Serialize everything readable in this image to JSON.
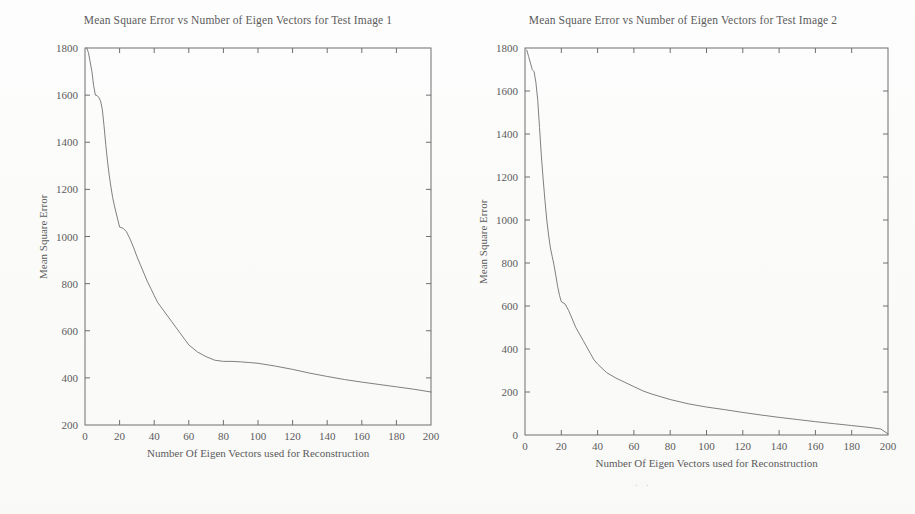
{
  "page": {
    "background": "#ffffff",
    "ink_color": "#5b5b5b",
    "axis_color": "#6e6e6e"
  },
  "figures": [
    {
      "id": "figure-1",
      "title": "Mean Square Error vs Number of Eigen Vectors for Test Image 1",
      "xlabel": "Number Of Eigen Vectors used for Reconstruction",
      "ylabel": "Mean Square Error"
    },
    {
      "id": "figure-2",
      "title": "Mean Square Error vs Number of Eigen Vectors for Test Image 2",
      "xlabel": "Number Of Eigen Vectors used for Reconstruction",
      "ylabel": "Mean Square Error"
    }
  ],
  "artifacts": {
    "scan_smudge_below_fig2": ". ."
  },
  "chart_data": [
    {
      "type": "line",
      "title": "Mean Square Error vs Number of Eigen Vectors for Test Image 1",
      "xlabel": "Number Of Eigen Vectors used for Reconstruction",
      "ylabel": "Mean Square Error",
      "xlim": [
        0,
        200
      ],
      "ylim": [
        200,
        1800
      ],
      "xticks": [
        0,
        20,
        40,
        60,
        80,
        100,
        120,
        140,
        160,
        180,
        200
      ],
      "yticks": [
        200,
        400,
        600,
        800,
        1000,
        1200,
        1400,
        1600,
        1800
      ],
      "grid": false,
      "legend": null,
      "line_color": "#6a6a6a",
      "series": [
        {
          "name": "Test Image 1 MSE",
          "x": [
            1,
            2,
            3,
            4,
            5,
            6,
            7,
            8,
            9,
            10,
            11,
            12,
            13,
            14,
            15,
            16,
            17,
            18,
            19,
            20,
            22,
            24,
            26,
            28,
            30,
            32,
            34,
            36,
            38,
            40,
            42,
            44,
            46,
            48,
            50,
            52,
            55,
            58,
            60,
            65,
            70,
            75,
            80,
            85,
            90,
            95,
            100,
            110,
            120,
            130,
            140,
            150,
            160,
            170,
            180,
            190,
            200
          ],
          "y": [
            1800,
            1780,
            1740,
            1700,
            1640,
            1600,
            1598,
            1590,
            1575,
            1540,
            1470,
            1390,
            1320,
            1260,
            1210,
            1165,
            1130,
            1100,
            1070,
            1040,
            1035,
            1020,
            990,
            955,
            915,
            880,
            845,
            810,
            780,
            750,
            720,
            700,
            680,
            660,
            640,
            620,
            590,
            560,
            540,
            510,
            490,
            475,
            470,
            470,
            468,
            465,
            462,
            450,
            436,
            420,
            406,
            393,
            382,
            372,
            362,
            352,
            340
          ]
        }
      ]
    },
    {
      "type": "line",
      "title": "Mean Square Error vs Number of Eigen Vectors for Test Image 2",
      "xlabel": "Number Of Eigen Vectors used for Reconstruction",
      "ylabel": "Mean Square Error",
      "xlim": [
        0,
        200
      ],
      "ylim": [
        0,
        1800
      ],
      "xticks": [
        0,
        20,
        40,
        60,
        80,
        100,
        120,
        140,
        160,
        180,
        200
      ],
      "yticks": [
        0,
        200,
        400,
        600,
        800,
        1000,
        1200,
        1400,
        1600,
        1800
      ],
      "grid": false,
      "legend": null,
      "line_color": "#6a6a6a",
      "series": [
        {
          "name": "Test Image 2 MSE",
          "x": [
            1,
            2,
            3,
            4,
            5,
            6,
            7,
            8,
            9,
            10,
            11,
            12,
            13,
            14,
            15,
            16,
            17,
            18,
            19,
            20,
            22,
            24,
            26,
            28,
            30,
            32,
            34,
            36,
            38,
            40,
            45,
            50,
            55,
            60,
            65,
            70,
            80,
            90,
            100,
            110,
            120,
            130,
            140,
            150,
            160,
            170,
            180,
            190,
            196,
            200
          ],
          "y": [
            1790,
            1760,
            1730,
            1700,
            1690,
            1640,
            1560,
            1430,
            1300,
            1190,
            1090,
            1000,
            930,
            870,
            830,
            790,
            740,
            690,
            650,
            620,
            610,
            580,
            540,
            500,
            470,
            440,
            410,
            380,
            350,
            330,
            290,
            265,
            245,
            225,
            205,
            190,
            165,
            145,
            130,
            118,
            105,
            93,
            82,
            72,
            62,
            53,
            44,
            35,
            28,
            5
          ]
        }
      ]
    }
  ]
}
